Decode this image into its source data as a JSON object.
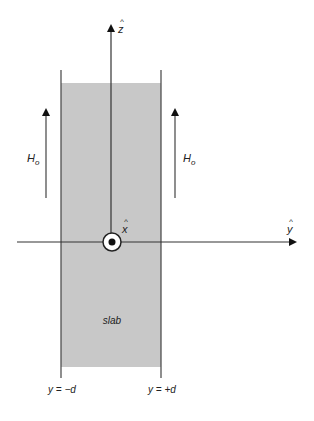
{
  "diagram": {
    "axes": {
      "z": {
        "label": "z",
        "hat": "^"
      },
      "y": {
        "label": "y",
        "hat": "^"
      },
      "x": {
        "label": "x",
        "hat": "^",
        "direction": "out-of-page"
      }
    },
    "field": {
      "left_label": "H",
      "left_subscript": "o",
      "right_label": "H",
      "right_subscript": "o"
    },
    "slab": {
      "label": "slab",
      "fill_color": "#c8c8c8"
    },
    "boundaries": {
      "left": "y = −d",
      "right": "y = +d"
    }
  }
}
